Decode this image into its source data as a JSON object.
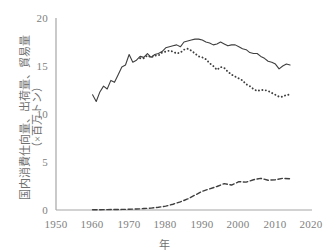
{
  "chart_data": {
    "type": "line",
    "title": "",
    "xlabel": "年",
    "ylabel_line1": "国内消費仕向量、出荷量、貿易量",
    "ylabel_line2": "（×百万トン）",
    "xlim": [
      1950,
      2020
    ],
    "ylim": [
      0,
      20
    ],
    "xticks": [
      1950,
      1960,
      1970,
      1980,
      1990,
      2000,
      2010,
      2020
    ],
    "yticks": [
      0,
      5,
      10,
      15,
      20
    ],
    "grid": false,
    "legend": "none",
    "axis_color": "#808080",
    "series": [
      {
        "name": "国内消費仕向量",
        "style": "solid",
        "color": "#3f3f3f",
        "x": [
          1960,
          1961,
          1962,
          1963,
          1964,
          1965,
          1966,
          1967,
          1968,
          1969,
          1970,
          1971,
          1972,
          1973,
          1974,
          1975,
          1976,
          1977,
          1978,
          1979,
          1980,
          1981,
          1982,
          1983,
          1984,
          1985,
          1986,
          1987,
          1988,
          1989,
          1990,
          1991,
          1992,
          1993,
          1994,
          1995,
          1996,
          1997,
          1998,
          1999,
          2000,
          2001,
          2002,
          2003,
          2004,
          2005,
          2006,
          2007,
          2008,
          2009,
          2010,
          2011,
          2012,
          2013,
          2014
        ],
        "values": [
          12.0,
          11.3,
          12.3,
          12.9,
          12.6,
          13.5,
          13.3,
          14.1,
          14.9,
          15.1,
          16.2,
          15.4,
          15.6,
          16.0,
          15.9,
          16.3,
          15.9,
          16.2,
          16.3,
          16.5,
          16.9,
          17.0,
          17.1,
          17.2,
          17.0,
          17.5,
          17.6,
          17.7,
          17.8,
          17.8,
          17.7,
          17.5,
          17.4,
          17.2,
          17.3,
          17.5,
          17.3,
          17.1,
          17.2,
          17.2,
          17.0,
          16.8,
          16.7,
          16.4,
          16.3,
          16.3,
          16.0,
          15.8,
          15.5,
          15.4,
          15.2,
          14.7,
          15.0,
          15.2,
          15.1
        ]
      },
      {
        "name": "出荷量",
        "style": "dotted",
        "color": "#3f3f3f",
        "x": [
          1973,
          1974,
          1975,
          1976,
          1977,
          1978,
          1979,
          1980,
          1981,
          1982,
          1983,
          1984,
          1985,
          1986,
          1987,
          1988,
          1989,
          1990,
          1991,
          1992,
          1993,
          1994,
          1995,
          1996,
          1997,
          1998,
          1999,
          2000,
          2001,
          2002,
          2003,
          2004,
          2005,
          2006,
          2007,
          2008,
          2009,
          2010,
          2011,
          2012,
          2013,
          2014
        ],
        "values": [
          15.8,
          15.8,
          16.1,
          15.9,
          16.1,
          16.1,
          16.4,
          16.5,
          16.6,
          16.5,
          16.3,
          16.4,
          16.7,
          16.8,
          16.6,
          16.3,
          16.0,
          15.9,
          15.7,
          15.3,
          15.0,
          14.6,
          14.9,
          14.8,
          14.4,
          14.1,
          13.9,
          13.7,
          13.5,
          13.1,
          12.9,
          12.6,
          12.4,
          12.5,
          12.5,
          12.4,
          12.2,
          12.0,
          11.8,
          11.8,
          12.0,
          12.0
        ]
      },
      {
        "name": "貿易量",
        "style": "dashed",
        "color": "#3f3f3f",
        "x": [
          1960,
          1962,
          1964,
          1966,
          1968,
          1970,
          1972,
          1974,
          1976,
          1978,
          1980,
          1982,
          1984,
          1986,
          1988,
          1990,
          1992,
          1994,
          1996,
          1998,
          2000,
          2002,
          2004,
          2006,
          2008,
          2010,
          2012,
          2014
        ],
        "values": [
          0.02,
          0.03,
          0.04,
          0.05,
          0.06,
          0.08,
          0.1,
          0.15,
          0.2,
          0.28,
          0.4,
          0.6,
          0.85,
          1.15,
          1.55,
          1.95,
          2.2,
          2.45,
          2.75,
          2.6,
          2.95,
          2.9,
          3.15,
          3.3,
          3.1,
          3.15,
          3.3,
          3.25
        ]
      }
    ]
  }
}
